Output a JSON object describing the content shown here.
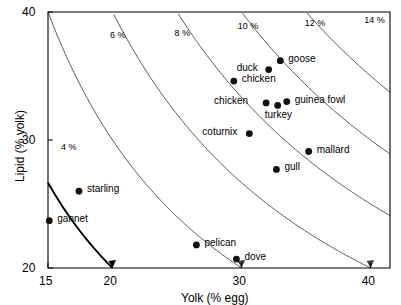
{
  "chart_data": {
    "type": "scatter",
    "title": "",
    "xlabel": "Yolk (% egg)",
    "ylabel": "Lipid (% yolk)",
    "xlim": [
      15,
      41.5
    ],
    "ylim": [
      20,
      40
    ],
    "xticks": [
      15,
      20,
      30,
      40
    ],
    "yticks": [
      20,
      30,
      40
    ],
    "grid": false,
    "legend": "none",
    "points": [
      {
        "label": "goose",
        "x": 33.0,
        "y": 36.2,
        "label_dx": 8,
        "label_dy": -4
      },
      {
        "label": "duck",
        "x": 32.1,
        "y": 35.5,
        "label_dx": -32,
        "label_dy": -4
      },
      {
        "label": "chicken",
        "x": 29.4,
        "y": 34.6,
        "label_dx": 8,
        "label_dy": -4
      },
      {
        "label": "chicken",
        "x": 31.9,
        "y": 32.9,
        "label_dx": -52,
        "label_dy": -4
      },
      {
        "label": "guinea fowl",
        "x": 33.5,
        "y": 33.0,
        "label_dx": 8,
        "label_dy": -4
      },
      {
        "label": "turkey",
        "x": 32.8,
        "y": 32.7,
        "label_dx": -13,
        "label_dy": 8
      },
      {
        "label": "coturnix",
        "x": 30.6,
        "y": 30.5,
        "label_dx": -47,
        "label_dy": -4
      },
      {
        "label": "mallard",
        "x": 35.2,
        "y": 29.1,
        "label_dx": 8,
        "label_dy": -4
      },
      {
        "label": "gull",
        "x": 32.7,
        "y": 27.7,
        "label_dx": 8,
        "label_dy": -4
      },
      {
        "label": "starling",
        "x": 17.4,
        "y": 26.0,
        "label_dx": 8,
        "label_dy": -4
      },
      {
        "label": "gannet",
        "x": 15.1,
        "y": 23.7,
        "label_dx": 8,
        "label_dy": -4
      },
      {
        "label": "pelican",
        "x": 26.5,
        "y": 21.8,
        "label_dx": 8,
        "label_dy": -4
      },
      {
        "label": "dove",
        "x": 29.6,
        "y": 20.7,
        "label_dx": 8,
        "label_dy": -4
      }
    ],
    "contours": [
      {
        "label": "4 %",
        "value": 4,
        "bold": true,
        "label_x": 16.0,
        "label_y": 29.4
      },
      {
        "label": "6 %",
        "value": 6,
        "bold": false,
        "label_x": 19.8,
        "label_y": 38.1
      },
      {
        "label": "8 %",
        "value": 8,
        "bold": false,
        "label_x": 24.8,
        "label_y": 38.3
      },
      {
        "label": "10 %",
        "value": 10,
        "bold": false,
        "label_x": 29.7,
        "label_y": 38.8
      },
      {
        "label": "12 %",
        "value": 12,
        "bold": false,
        "label_x": 34.9,
        "label_y": 39.1
      },
      {
        "label": "14 %",
        "value": 14,
        "bold": false,
        "label_x": 39.5,
        "label_y": 39.3
      }
    ],
    "contour_note": "iso-lines of total-egg lipid: Lipid(%yolk) x Yolk(%egg) / 100 = constant"
  },
  "colors": {
    "axis": "#000000",
    "marker": "#111111",
    "contour": "#3a3a3a",
    "contour_bold": "#000000",
    "background": "#ffffff"
  }
}
